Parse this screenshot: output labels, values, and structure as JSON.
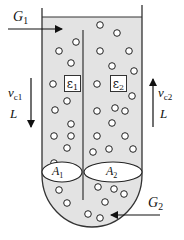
{
  "diagram": {
    "type": "two-column bubble reactor / riser-downcomer schematic",
    "colors": {
      "liquid_fill": "#e3e3e3",
      "outline": "#333333",
      "bubble_fill": "#ffffff",
      "bubble_stroke": "#222222",
      "background": "#ffffff"
    },
    "labels": {
      "gas_inlet_1": {
        "main": "G",
        "sub": "1"
      },
      "gas_inlet_2": {
        "main": "G",
        "sub": "2"
      },
      "velocity_1": {
        "main": "v",
        "sub": "c1"
      },
      "velocity_2": {
        "main": "v",
        "sub": "c2"
      },
      "length_left": "L",
      "length_right": "L",
      "holdup_1": {
        "main": "ε",
        "sub": "1"
      },
      "holdup_2": {
        "main": "ε",
        "sub": "2"
      },
      "area_1": {
        "main": "A",
        "sub": "1"
      },
      "area_2": {
        "main": "A",
        "sub": "2"
      }
    },
    "arrows": {
      "G1": "points right into left column at top",
      "G2": "points left into vessel bottom",
      "vc1": "points down (left column)",
      "vc2": "points up (right column)"
    }
  }
}
